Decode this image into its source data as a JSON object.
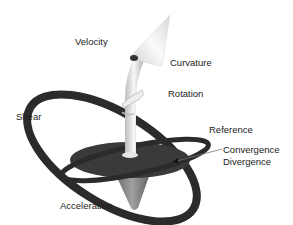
{
  "diagram": {
    "labels": {
      "velocity": "Velocity",
      "curvature": "Curvature",
      "rotation": "Rotation",
      "shear": "Shear",
      "reference": "Reference",
      "convergence": "Convergence",
      "divergence": "Divergence",
      "acceleration": "Acceleration"
    },
    "colors": {
      "disc": "#3a3a3a",
      "ring": "#2b2b2b",
      "arrow_light": "#f2f2f2",
      "arrow_shade": "#b5b5b5",
      "cone": "#8a8a8a"
    }
  }
}
